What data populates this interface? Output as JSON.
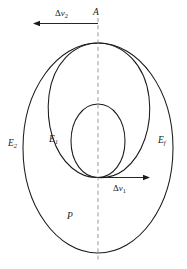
{
  "figure": {
    "kind": "orbital-transfer-diagram",
    "background_color": "#ffffff",
    "stroke_color": "#1a1a1a",
    "axis_color": "#9a9a9a"
  },
  "labels": {
    "apoapsis_point": "A",
    "inner_orbit": "E",
    "inner_orbit_sub": "1",
    "outer_orbit": "E",
    "outer_orbit_sub": "2",
    "final_orbit": "E",
    "final_orbit_sub": "f",
    "periapsis_point": "P"
  },
  "vectors": [
    {
      "name": "delta-v-1",
      "symbol": "Δ",
      "variable": "v",
      "subscript": "1",
      "direction": "right",
      "origin_x": 98,
      "origin_y": 177,
      "tip_x": 150,
      "tip_y": 177
    },
    {
      "name": "delta-v-2",
      "symbol": "Δ",
      "variable": "v",
      "subscript": "2",
      "direction": "left",
      "origin_x": 98,
      "origin_y": 23,
      "tip_x": 33,
      "tip_y": 23
    }
  ],
  "geometry": {
    "axis_line": {
      "x": 98,
      "y_top": 18,
      "y_bottom": 262
    },
    "outer_ellipse": {
      "cx": 98,
      "cy": 148,
      "rx": 75,
      "ry": 105,
      "label": "E2"
    },
    "final_ellipse": {
      "cx": 98,
      "cy": 110,
      "rx": 47,
      "ry": 67,
      "label": "Ef"
    },
    "inner_ellipse": {
      "cx": 98,
      "cy": 141,
      "rx": 27,
      "ry": 37,
      "label": "E1"
    },
    "apoapsis": {
      "x": 98,
      "y": 43
    },
    "periapsis": {
      "x": 98,
      "y": 253
    },
    "transfer_node": {
      "x": 98,
      "y": 177
    }
  }
}
